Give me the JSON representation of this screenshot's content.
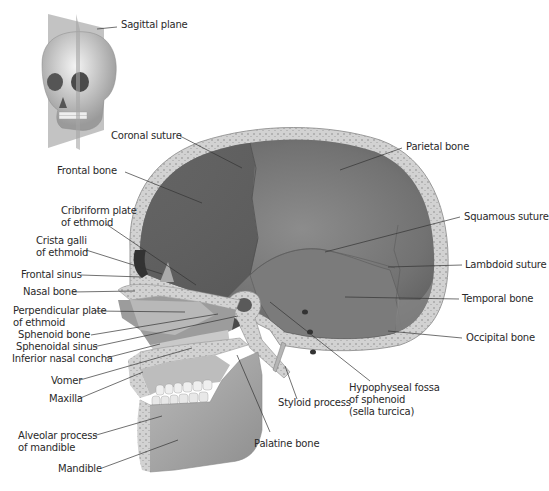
{
  "figure": {
    "inset_label": "Sagittal plane",
    "colors": {
      "bone_dark": "#5f5f5f",
      "bone_mid": "#8a8a8a",
      "bone_light": "#b4b4b4",
      "bone_pale": "#d6d6d6",
      "spongy": "#cfcfcf",
      "leader": "#333333",
      "text": "#2a2a2a"
    }
  },
  "labels": {
    "sagittal_plane": "Sagittal plane",
    "coronal_suture": "Coronal suture",
    "parietal_bone": "Parietal bone",
    "frontal_bone": "Frontal bone",
    "cribriform_1": "Cribriform plate",
    "cribriform_2": "of ethmoid",
    "crista_1": "Crista galli",
    "crista_2": "of ethmoid",
    "squamous_suture": "Squamous suture",
    "lambdoid_suture": "Lambdoid suture",
    "frontal_sinus": "Frontal sinus",
    "nasal_bone": "Nasal bone",
    "temporal_bone": "Temporal bone",
    "perpendicular_1": "Perpendicular plate",
    "perpendicular_2": "of ethmoid",
    "occipital_bone": "Occipital bone",
    "sphenoid_bone": "Sphenoid bone",
    "sphenoidal_sinus": "Sphenoidal sinus",
    "inferior_nasal_concha": "Inferior nasal concha",
    "vomer": "Vomer",
    "maxilla": "Maxilla",
    "hypophyseal_1": "Hypophyseal fossa",
    "hypophyseal_2": "of sphenoid",
    "hypophyseal_3": "(sella turcica)",
    "styloid_process": "Styloid process",
    "alveolar_1": "Alveolar process",
    "alveolar_2": "of mandible",
    "palatine_bone": "Palatine bone",
    "mandible": "Mandible"
  }
}
